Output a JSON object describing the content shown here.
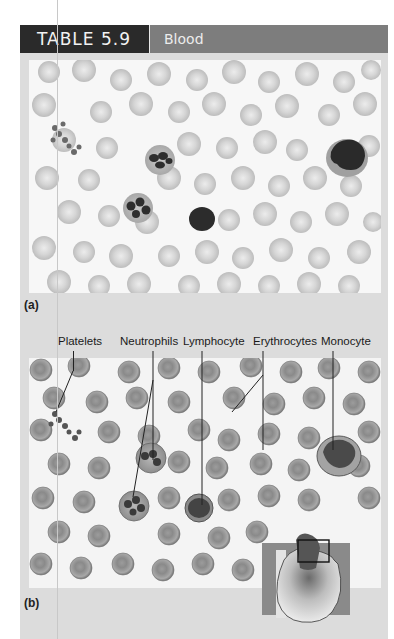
{
  "header": {
    "table_number": "TABLE 5.9",
    "title": "Blood",
    "colors": {
      "number_bg": "#2a2a2a",
      "title_bg": "#7d7d7d"
    }
  },
  "figure": {
    "panel_a": {
      "label": "(a)",
      "description": "light micrograph of blood smear"
    },
    "panel_b": {
      "label": "(b)",
      "description": "illustration of blood cells",
      "callouts": [
        "Platelets",
        "Neutrophils",
        "Lymphocyte",
        "Erythrocytes",
        "Monocyte"
      ]
    },
    "inset": {
      "icon": "heart-icon",
      "description": "heart illustration with highlighted box"
    }
  }
}
